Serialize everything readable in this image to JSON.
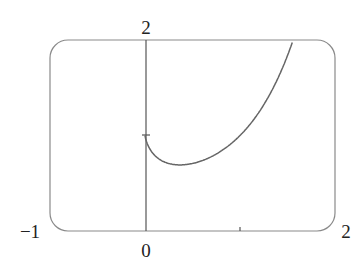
{
  "chart_data": {
    "type": "line",
    "title": "",
    "xlabel": "",
    "ylabel": "",
    "xlim": [
      -1,
      2
    ],
    "ylim": [
      0,
      2
    ],
    "grid": false,
    "legend": null,
    "function": "y = x^x",
    "series": [
      {
        "name": "x^x",
        "x": [
          0.0,
          0.05,
          0.1,
          0.2,
          0.3,
          0.368,
          0.5,
          0.7,
          0.9,
          1.0,
          1.2,
          1.4,
          1.55
        ],
        "values": [
          1.0,
          0.861,
          0.794,
          0.725,
          0.697,
          0.692,
          0.707,
          0.779,
          0.91,
          1.0,
          1.245,
          1.602,
          1.973
        ]
      }
    ],
    "tick_labels": {
      "x_left": "−1",
      "x_origin": "0",
      "x_right": "2",
      "y_top": "2"
    },
    "ticks": {
      "x_minor": [
        1
      ],
      "y_minor": [
        1
      ]
    }
  },
  "colors": {
    "axis": "#555555",
    "curve": "#666666",
    "frame": "#888888",
    "text": "#222222"
  }
}
